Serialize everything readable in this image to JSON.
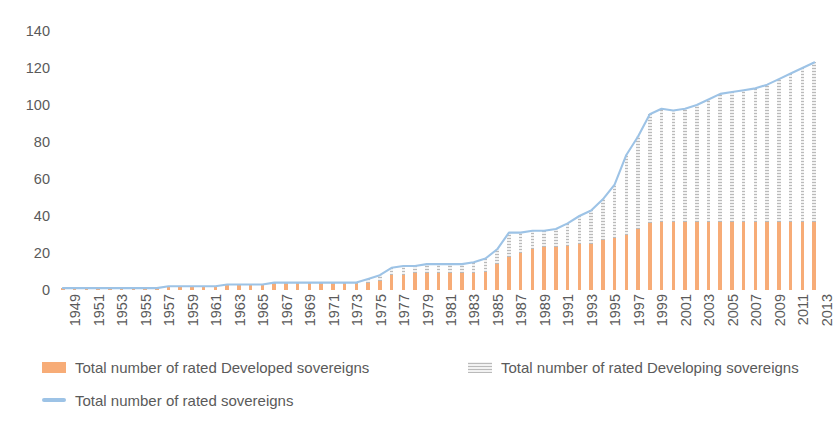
{
  "chart_data": {
    "type": "bar",
    "title": "",
    "subtitle": "",
    "xlabel": "",
    "ylabel": "",
    "ylim": [
      0,
      140
    ],
    "yticks": [
      0,
      20,
      40,
      60,
      80,
      100,
      120,
      140
    ],
    "grid": false,
    "legend_position": "bottom-left",
    "stacked": true,
    "tick_label_step": 2,
    "categories": [
      "1949",
      "1950",
      "1951",
      "1952",
      "1953",
      "1954",
      "1955",
      "1956",
      "1957",
      "1958",
      "1959",
      "1960",
      "1961",
      "1962",
      "1963",
      "1964",
      "1965",
      "1966",
      "1967",
      "1968",
      "1969",
      "1970",
      "1971",
      "1972",
      "1973",
      "1974",
      "1975",
      "1976",
      "1977",
      "1978",
      "1979",
      "1980",
      "1981",
      "1982",
      "1983",
      "1984",
      "1985",
      "1986",
      "1987",
      "1988",
      "1989",
      "1990",
      "1991",
      "1992",
      "1993",
      "1994",
      "1995",
      "1996",
      "1997",
      "1998",
      "1999",
      "2000",
      "2001",
      "2002",
      "2003",
      "2004",
      "2005",
      "2006",
      "2007",
      "2008",
      "2009",
      "2010",
      "2011",
      "2012",
      "2013"
    ],
    "x_tick_labels": [
      "1949",
      "1951",
      "1953",
      "1955",
      "1957",
      "1959",
      "1961",
      "1963",
      "1965",
      "1967",
      "1969",
      "1971",
      "1973",
      "1975",
      "1977",
      "1979",
      "1981",
      "1983",
      "1985",
      "1987",
      "1989",
      "1991",
      "1993",
      "1995",
      "1997",
      "1999",
      "2001",
      "2003",
      "2005",
      "2007",
      "2009",
      "2011",
      "2013"
    ],
    "series": [
      {
        "name": "Total number of rated Developed sovereigns",
        "kind": "bar",
        "color": "#f7ac77",
        "values": [
          1,
          1,
          1,
          1,
          1,
          1,
          1,
          1,
          1,
          2,
          2,
          2,
          2,
          2,
          3,
          3,
          3,
          3,
          3,
          3,
          3,
          3,
          3,
          3,
          3,
          3,
          4,
          5,
          8,
          8,
          9,
          9,
          9,
          9,
          9,
          9,
          10,
          14,
          18,
          20,
          22,
          23,
          23,
          24,
          25,
          25,
          27,
          28,
          30,
          33,
          36,
          37,
          37,
          37,
          37,
          37,
          37,
          37,
          37,
          37,
          37,
          37,
          37,
          37,
          37
        ]
      },
      {
        "name": "Total number of rated Developing sovereigns",
        "kind": "bar",
        "color": "#f2f2f2",
        "pattern": "dotted",
        "values": [
          0,
          0,
          0,
          0,
          0,
          0,
          0,
          0,
          0,
          0,
          0,
          0,
          0,
          0,
          0,
          0,
          0,
          0,
          1,
          1,
          1,
          1,
          1,
          1,
          1,
          1,
          2,
          3,
          4,
          5,
          4,
          5,
          5,
          5,
          5,
          6,
          7,
          8,
          13,
          11,
          10,
          9,
          10,
          12,
          15,
          18,
          22,
          29,
          43,
          50,
          59,
          61,
          60,
          61,
          63,
          66,
          69,
          70,
          71,
          72,
          74,
          77,
          80,
          83,
          86
        ]
      },
      {
        "name": "Total number of rated sovereigns",
        "kind": "line",
        "color": "#9dc3e6",
        "values": [
          1,
          1,
          1,
          1,
          1,
          1,
          1,
          1,
          1,
          2,
          2,
          2,
          2,
          2,
          3,
          3,
          3,
          3,
          4,
          4,
          4,
          4,
          4,
          4,
          4,
          4,
          6,
          8,
          12,
          13,
          13,
          14,
          14,
          14,
          14,
          15,
          17,
          22,
          31,
          31,
          32,
          32,
          33,
          36,
          40,
          43,
          49,
          57,
          73,
          83,
          95,
          98,
          97,
          98,
          100,
          103,
          106,
          107,
          108,
          109,
          111,
          114,
          117,
          120,
          123
        ]
      }
    ]
  },
  "legend": {
    "items": [
      {
        "label": "Total number of rated Developed sovereigns",
        "swatch": "bar-orange-swatch"
      },
      {
        "label": "Total number of rated Developing sovereigns",
        "swatch": "bar-grey-dotted-swatch"
      },
      {
        "label": "Total number of rated sovereigns",
        "swatch": "line-blue-swatch"
      }
    ]
  },
  "colors": {
    "developed": "#f7ac77",
    "developing": "#f2f2f2",
    "developing_pattern": "#8c8c8c",
    "line": "#9dc3e6",
    "text": "#5a5a5a",
    "background": "#ffffff"
  }
}
